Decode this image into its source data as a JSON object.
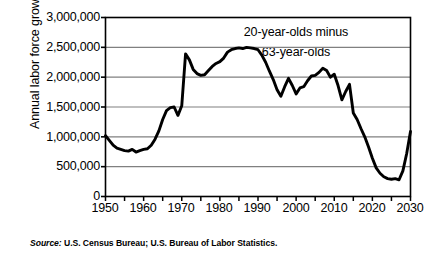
{
  "chart_data": {
    "type": "line",
    "title": "",
    "subtitle": "",
    "xlabel": "",
    "ylabel": "Annual labor force growth",
    "xlim": [
      1950,
      2030
    ],
    "ylim": [
      0,
      3000000
    ],
    "grid": true,
    "grid_axis": "y",
    "legend_position": "none",
    "annotations": [
      {
        "text": "20-year-olds minus",
        "x": 2000,
        "y": 2780000
      },
      {
        "text": "63-year-olds",
        "x": 2000,
        "y": 2560000
      }
    ],
    "xticks_major": [
      1950,
      1960,
      1970,
      1980,
      1990,
      2000,
      2010,
      2020,
      2030
    ],
    "xticks_minor_step": 5,
    "yticks": [
      0,
      500000,
      1000000,
      1500000,
      2000000,
      2500000,
      3000000
    ],
    "ytick_labels": [
      "0",
      "500,000",
      "1,000,000",
      "1,500,000",
      "2,000,000",
      "2,500,000",
      "3,000,000"
    ],
    "xtick_labels": [
      "1950",
      "1960",
      "1970",
      "1980",
      "1990",
      "2000",
      "2010",
      "2020",
      "2030"
    ],
    "series": [
      {
        "name": "20-year-olds minus 63-year-olds",
        "color": "#000000",
        "x": [
          1950,
          1951,
          1952,
          1953,
          1954,
          1955,
          1956,
          1957,
          1958,
          1959,
          1960,
          1961,
          1962,
          1963,
          1964,
          1965,
          1966,
          1967,
          1968,
          1969,
          1970,
          1971,
          1972,
          1973,
          1974,
          1975,
          1976,
          1977,
          1978,
          1979,
          1980,
          1981,
          1982,
          1983,
          1984,
          1985,
          1986,
          1987,
          1988,
          1989,
          1990,
          1991,
          1992,
          1993,
          1994,
          1995,
          1996,
          1997,
          1998,
          1999,
          2000,
          2001,
          2002,
          2003,
          2004,
          2005,
          2006,
          2007,
          2008,
          2009,
          2010,
          2011,
          2012,
          2013,
          2014,
          2015,
          2016,
          2017,
          2018,
          2019,
          2020,
          2021,
          2022,
          2023,
          2024,
          2025,
          2026,
          2027,
          2028,
          2029,
          2030
        ],
        "y": [
          1020000,
          940000,
          860000,
          810000,
          790000,
          770000,
          760000,
          790000,
          745000,
          770000,
          790000,
          800000,
          860000,
          960000,
          1100000,
          1290000,
          1440000,
          1490000,
          1500000,
          1360000,
          1520000,
          2390000,
          2290000,
          2130000,
          2060000,
          2030000,
          2040000,
          2110000,
          2180000,
          2230000,
          2260000,
          2320000,
          2420000,
          2460000,
          2480000,
          2490000,
          2480000,
          2500000,
          2490000,
          2480000,
          2460000,
          2370000,
          2250000,
          2100000,
          1960000,
          1790000,
          1680000,
          1840000,
          1980000,
          1860000,
          1720000,
          1820000,
          1840000,
          1940000,
          2020000,
          2030000,
          2080000,
          2150000,
          2110000,
          2000000,
          2050000,
          1860000,
          1620000,
          1760000,
          1880000,
          1400000,
          1290000,
          1140000,
          1000000,
          830000,
          640000,
          480000,
          390000,
          330000,
          300000,
          290000,
          300000,
          280000,
          430000,
          720000,
          1090000
        ]
      }
    ],
    "source_lead": "Source:",
    "source_text": " U.S. Census Bureau; U.S. Bureau of Labor Statistics."
  },
  "colors": {
    "line": "#000000",
    "grid": "#808080",
    "axis": "#000000",
    "background": "#ffffff"
  }
}
